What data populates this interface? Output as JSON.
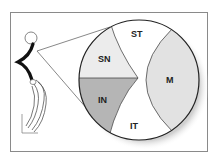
{
  "diagram": {
    "sectors": [
      {
        "id": "ST",
        "label": "ST",
        "fill": "#ffffff"
      },
      {
        "id": "SN",
        "label": "SN",
        "fill": "#ececec"
      },
      {
        "id": "M",
        "label": "M",
        "fill": "#e2e2e2"
      },
      {
        "id": "IN",
        "label": "IN",
        "fill": "#b5b5b5"
      },
      {
        "id": "IT",
        "label": "IT",
        "fill": "#ffffff"
      }
    ],
    "colors": {
      "outline": "#222222",
      "frame": "#8a8a8a",
      "shadow": "#d9d9d9",
      "nerve": "#111111"
    }
  }
}
